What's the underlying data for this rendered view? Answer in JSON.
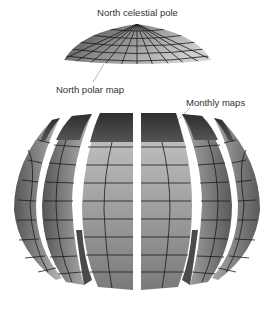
{
  "figure": {
    "labels": {
      "north_celestial_pole": "North celestial pole",
      "north_polar_map": "North polar map",
      "monthly_maps": "Monthly maps"
    },
    "parts": {
      "cap": {
        "name": "North polar cap",
        "grid": "meridians and parallels"
      },
      "gores": {
        "count": 6,
        "name": "Monthly map segments"
      }
    },
    "colors": {
      "background": "#ffffff",
      "surface_light": "#bdbdbd",
      "surface_dark": "#4a4a4a",
      "grid_line": "#1a1a1a",
      "text": "#333333"
    }
  }
}
